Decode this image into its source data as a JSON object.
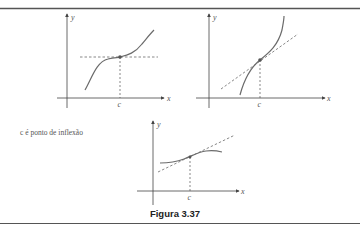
{
  "figure": {
    "caption": "Figura 3.37",
    "note": "c é ponto de inflexão",
    "colors": {
      "curve": "#6b6b6b",
      "axis": "#444444",
      "dashed": "#555555",
      "border": "#555555"
    }
  },
  "graphs": [
    {
      "id": "graph-1",
      "x_label": "x",
      "y_label": "y",
      "point_label": "c",
      "tangent": "horizontal"
    },
    {
      "id": "graph-2",
      "x_label": "x",
      "y_label": "y",
      "point_label": "c",
      "tangent": "oblique"
    },
    {
      "id": "graph-3",
      "x_label": "x",
      "y_label": "y",
      "point_label": "c",
      "tangent": "oblique"
    }
  ]
}
